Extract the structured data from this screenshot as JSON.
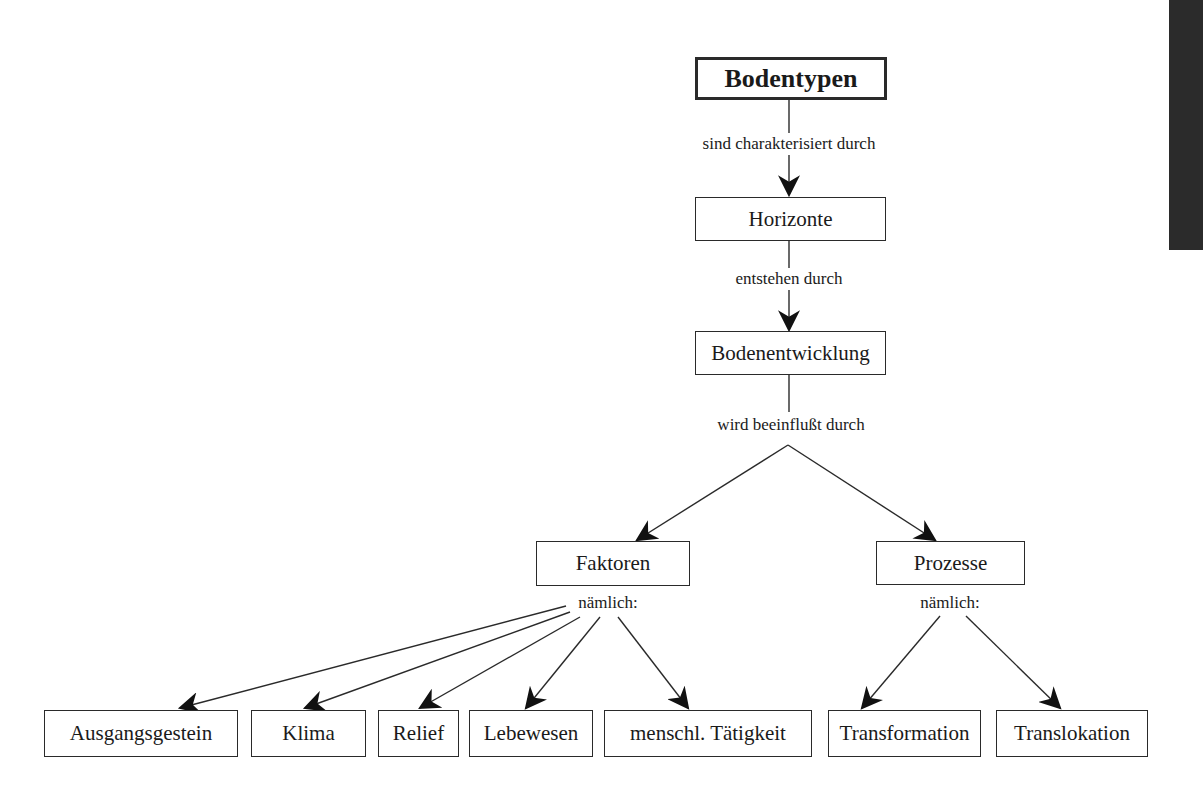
{
  "diagram": {
    "root": {
      "label": "Bodentypen"
    },
    "nodes": {
      "horizonte": {
        "label": "Horizonte"
      },
      "bodenentwicklung": {
        "label": "Bodenentwicklung"
      },
      "faktoren": {
        "label": "Faktoren"
      },
      "prozesse": {
        "label": "Prozesse"
      },
      "ausgangsgestein": {
        "label": "Ausgangsgestein"
      },
      "klima": {
        "label": "Klima"
      },
      "relief": {
        "label": "Relief"
      },
      "lebewesen": {
        "label": "Lebewesen"
      },
      "menschl_taetigkeit": {
        "label": "menschl. Tätigkeit"
      },
      "transformation": {
        "label": "Transformation"
      },
      "translokation": {
        "label": "Translokation"
      }
    },
    "edge_labels": {
      "root_to_horizonte": "sind charakterisiert durch",
      "horizonte_to_bodenentwicklung": "entstehen durch",
      "bodenentwicklung_branch": "wird beeinflußt durch",
      "faktoren_children": "nämlich:",
      "prozesse_children": "nämlich:"
    },
    "colors": {
      "line": "#2a2a2a",
      "edge_bar": "#2b2b2b",
      "background": "#ffffff"
    }
  }
}
